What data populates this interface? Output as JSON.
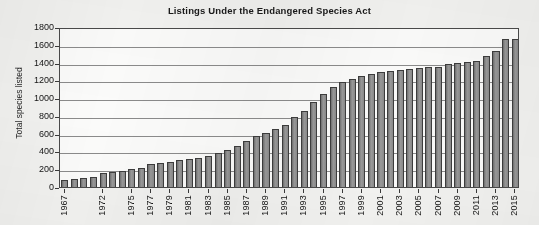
{
  "chart_data": {
    "type": "bar",
    "title": "Listings Under the Endangered Species Act",
    "xlabel": "",
    "ylabel": "Total species listed",
    "ylim": [
      0,
      1800
    ],
    "ytick_step": 200,
    "yticks": [
      0,
      200,
      400,
      600,
      800,
      1000,
      1200,
      1400,
      1600,
      1800
    ],
    "grid": true,
    "legend": null,
    "bar_color": "#8a8a8a",
    "bar_edge_color": "#3d3d3d",
    "categories": [
      "1967",
      "1968",
      "1969",
      "1970",
      "1972",
      "1973",
      "1974",
      "1975",
      "1976",
      "1977",
      "1978",
      "1979",
      "1980",
      "1981",
      "1982",
      "1983",
      "1984",
      "1985",
      "1986",
      "1987",
      "1988",
      "1989",
      "1990",
      "1991",
      "1992",
      "1993",
      "1994",
      "1995",
      "1996",
      "1997",
      "1998",
      "1999",
      "2000",
      "2001",
      "2002",
      "2003",
      "2004",
      "2005",
      "2006",
      "2007",
      "2008",
      "2009",
      "2010",
      "2011",
      "2012",
      "2013",
      "2014",
      "2015"
    ],
    "values": [
      78,
      88,
      96,
      110,
      160,
      170,
      185,
      200,
      210,
      255,
      265,
      280,
      300,
      315,
      330,
      350,
      385,
      420,
      460,
      520,
      570,
      610,
      650,
      700,
      790,
      860,
      960,
      1050,
      1120,
      1180,
      1220,
      1250,
      1270,
      1290,
      1300,
      1320,
      1330,
      1340,
      1350,
      1355,
      1380,
      1400,
      1410,
      1420,
      1470,
      1530,
      1660,
      1670
    ],
    "xtick_labels": [
      {
        "label": "1967",
        "index": 0
      },
      {
        "label": "1972",
        "index": 4
      },
      {
        "label": "1975",
        "index": 7
      },
      {
        "label": "1977",
        "index": 9
      },
      {
        "label": "1979",
        "index": 11
      },
      {
        "label": "1981",
        "index": 13
      },
      {
        "label": "1983",
        "index": 15
      },
      {
        "label": "1985",
        "index": 17
      },
      {
        "label": "1987",
        "index": 19
      },
      {
        "label": "1989",
        "index": 21
      },
      {
        "label": "1991",
        "index": 23
      },
      {
        "label": "1993",
        "index": 25
      },
      {
        "label": "1995",
        "index": 27
      },
      {
        "label": "1997",
        "index": 29
      },
      {
        "label": "1999",
        "index": 31
      },
      {
        "label": "2001",
        "index": 33
      },
      {
        "label": "2003",
        "index": 35
      },
      {
        "label": "2005",
        "index": 37
      },
      {
        "label": "2007",
        "index": 39
      },
      {
        "label": "2009",
        "index": 41
      },
      {
        "label": "2011",
        "index": 43
      },
      {
        "label": "2013",
        "index": 45
      },
      {
        "label": "2015",
        "index": 47
      }
    ]
  }
}
